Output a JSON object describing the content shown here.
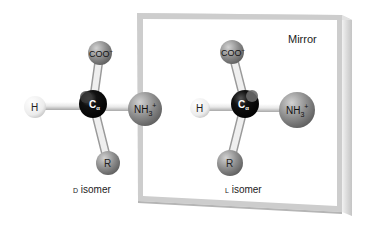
{
  "figure": {
    "mirror_label": "Mirror",
    "d_isomer": {
      "label_prefix": "D",
      "label_suffix": " isomer",
      "atoms": {
        "top": "COO",
        "top_charge": "−",
        "left": "H",
        "center": "C",
        "center_sub": "α",
        "right": "NH",
        "right_sub": "3",
        "right_charge": "+",
        "bottom": "R"
      }
    },
    "l_isomer": {
      "label_prefix": "L",
      "label_suffix": " isomer",
      "atoms": {
        "top": "COO",
        "top_charge": "−",
        "left": "H",
        "center": "C",
        "center_sub": "α",
        "right": "NH",
        "right_sub": "3",
        "right_charge": "+",
        "bottom": "R"
      }
    },
    "colors": {
      "carbon": "#0a0a0a",
      "hydrogen": "#f4f4f4",
      "group_gray": "#8a8a8a",
      "bond": "#e6e6e6",
      "mirror_frame": "#cfcfcf",
      "text": "#222222"
    }
  }
}
